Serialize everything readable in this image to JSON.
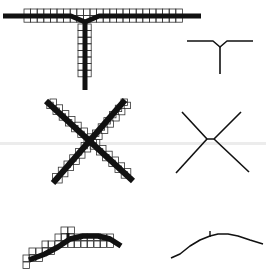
{
  "figure": {
    "colors": {
      "background": "#ffffff",
      "stroke": "#111111",
      "grid": "#333333",
      "scan_band": "#ececec"
    },
    "rows": [
      {
        "name": "t-junction",
        "left": {
          "kind": "thick-stroke-with-grid",
          "strokes": [
            {
              "points": [
                [
                  3,
                  16
                ],
                [
                  71,
                  16
                ],
                [
                  85,
                  22
                ],
                [
                  99,
                  16
                ],
                [
                  201,
                  16
                ]
              ],
              "width": 5
            },
            {
              "points": [
                [
                  85,
                  22
                ],
                [
                  85,
                  90
                ]
              ],
              "width": 5
            }
          ],
          "grids": [
            {
              "x": 24,
              "y": 9,
              "cols": 24,
              "rows": 2,
              "cell": 6.6
            },
            {
              "x": 78,
              "y": 24,
              "cols": 2,
              "rows": 8,
              "cell": 6.6
            }
          ]
        },
        "right": {
          "kind": "skeleton",
          "strokes": [
            {
              "points": [
                [
                  187,
                  41
                ],
                [
                  213,
                  41
                ],
                [
                  220,
                  47
                ],
                [
                  227,
                  41
                ],
                [
                  253,
                  41
                ]
              ],
              "width": 1.6
            },
            {
              "points": [
                [
                  220,
                  47
                ],
                [
                  220,
                  74
                ]
              ],
              "width": 1.6
            }
          ]
        }
      },
      {
        "name": "x-crossing",
        "left": {
          "kind": "thick-stroke-with-grid",
          "strokes": [
            {
              "points": [
                [
                  46,
                  101
                ],
                [
                  133,
                  181
                ]
              ],
              "width": 6
            },
            {
              "points": [
                [
                  125,
                  100
                ],
                [
                  53,
                  183
                ]
              ],
              "width": 6
            }
          ],
          "stairs": [
            {
              "from": [
                50,
                99
              ],
              "step": [
                6.2,
                5.8
              ],
              "count": 13
            },
            {
              "from": [
                121,
                99
              ],
              "step": [
                -5.7,
                6.2
              ],
              "count": 13
            }
          ],
          "cell": 6.4
        },
        "right": {
          "kind": "skeleton",
          "strokes": [
            {
              "points": [
                [
                  182,
                  112
                ],
                [
                  207,
                  139
                ],
                [
                  214,
                  139
                ],
                [
                  241,
                  112
                ]
              ],
              "width": 1.6
            },
            {
              "points": [
                [
                  207,
                  139
                ],
                [
                  176,
                  173
                ]
              ],
              "width": 1.6
            },
            {
              "points": [
                [
                  214,
                  139
                ],
                [
                  249,
                  172
                ]
              ],
              "width": 1.6
            }
          ]
        }
      },
      {
        "name": "curve",
        "left": {
          "kind": "thick-stroke-with-grid",
          "strokes": [
            {
              "points": [
                [
                  29,
                  260
                ],
                [
                  45,
                  254
                ],
                [
                  58,
                  247
                ],
                [
                  70,
                  239
                ],
                [
                  83,
                  236
                ],
                [
                  98,
                  236
                ],
                [
                  110,
                  239
                ],
                [
                  121,
                  246
                ]
              ],
              "width": 5.5
            },
            {
              "points": [
                [
                  68,
                  233
                ],
                [
                  68,
                  240
                ]
              ],
              "width": 3
            }
          ],
          "grid_cells": [
            [
              23,
              255
            ],
            [
              23,
              262
            ],
            [
              29,
              248
            ],
            [
              29,
              255
            ],
            [
              36,
              248
            ],
            [
              36,
              255
            ],
            [
              42,
              241
            ],
            [
              42,
              248
            ],
            [
              48,
              241
            ],
            [
              48,
              248
            ],
            [
              55,
              234
            ],
            [
              55,
              241
            ],
            [
              61,
              227
            ],
            [
              61,
              234
            ],
            [
              61,
              241
            ],
            [
              68,
              227
            ],
            [
              68,
              234
            ],
            [
              68,
              241
            ],
            [
              74,
              234
            ],
            [
              74,
              241
            ],
            [
              81,
              234
            ],
            [
              81,
              241
            ],
            [
              87,
              234
            ],
            [
              87,
              241
            ],
            [
              94,
              234
            ],
            [
              94,
              241
            ],
            [
              100,
              234
            ],
            [
              100,
              241
            ],
            [
              107,
              234
            ],
            [
              107,
              241
            ]
          ],
          "cell": 6.5
        },
        "right": {
          "kind": "skeleton",
          "strokes": [
            {
              "points": [
                [
                  171,
                  258
                ],
                [
                  180,
                  254
                ],
                [
                  190,
                  246
                ],
                [
                  200,
                  240
                ],
                [
                  210,
                  236
                ],
                [
                  218,
                  234
                ],
                [
                  228,
                  234
                ],
                [
                  238,
                  236
                ],
                [
                  250,
                  240
                ],
                [
                  263,
                  244
                ]
              ],
              "width": 1.6
            },
            {
              "points": [
                [
                  210,
                  231
                ],
                [
                  210,
                  237
                ]
              ],
              "width": 1.4
            }
          ]
        }
      }
    ],
    "scan_band_y": 142
  }
}
